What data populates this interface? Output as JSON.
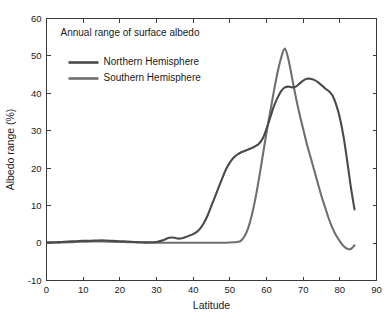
{
  "chart_data": {
    "type": "line",
    "title": "Annual range of surface albedo",
    "title_position": "inside-top-left",
    "xlabel": "Latitude",
    "ylabel": "Albedo range (%)",
    "xlim": [
      0,
      90
    ],
    "ylim": [
      -10,
      60
    ],
    "xticks": [
      0,
      10,
      20,
      30,
      40,
      50,
      60,
      70,
      80,
      90
    ],
    "yticks": [
      -10,
      0,
      10,
      20,
      30,
      40,
      50,
      60
    ],
    "xtick_labels": [
      "0",
      "10",
      "20",
      "30",
      "40",
      "50",
      "60",
      "70",
      "80",
      "90"
    ],
    "ytick_labels": [
      "-10",
      "0",
      "10",
      "20",
      "30",
      "40",
      "50",
      "60"
    ],
    "grid": false,
    "legend_position": "upper-left-inside",
    "series": [
      {
        "name": "Northern Hemisphere",
        "color": "#4a4a4a",
        "x": [
          0,
          2,
          4,
          6,
          8,
          10,
          12,
          14,
          16,
          18,
          20,
          22,
          24,
          26,
          28,
          30,
          32,
          33,
          34,
          35,
          36,
          37,
          38,
          39,
          40,
          41,
          42,
          43,
          44,
          45,
          46,
          47,
          48,
          49,
          50,
          51,
          52,
          53,
          54,
          55,
          56,
          57,
          58,
          59,
          60,
          61,
          62,
          63,
          64,
          65,
          66,
          67,
          68,
          69,
          70,
          71,
          72,
          73,
          74,
          75,
          76,
          77,
          78,
          79,
          80,
          81,
          82,
          83,
          84
        ],
        "values": [
          0.2,
          0.2,
          0.3,
          0.4,
          0.5,
          0.6,
          0.6,
          0.7,
          0.7,
          0.6,
          0.5,
          0.4,
          0.3,
          0.2,
          0.2,
          0.3,
          0.8,
          1.3,
          1.5,
          1.4,
          1.2,
          1.3,
          1.6,
          2.0,
          2.4,
          3.0,
          4.0,
          5.5,
          7.5,
          10.0,
          12.5,
          15.0,
          17.5,
          19.8,
          21.5,
          22.8,
          23.6,
          24.2,
          24.6,
          25.0,
          25.4,
          25.9,
          26.6,
          28.0,
          30.5,
          33.5,
          36.5,
          38.8,
          40.6,
          41.6,
          41.8,
          41.6,
          41.8,
          42.6,
          43.4,
          43.9,
          43.9,
          43.6,
          43.0,
          42.2,
          41.3,
          40.6,
          39.4,
          37.0,
          33.5,
          28.5,
          22.0,
          15.0,
          9.0
        ]
      },
      {
        "name": "Southern Hemisphere",
        "color": "#6f6f6f",
        "x": [
          0,
          2,
          4,
          6,
          8,
          10,
          12,
          14,
          16,
          18,
          20,
          22,
          24,
          26,
          28,
          30,
          32,
          34,
          36,
          38,
          40,
          42,
          44,
          46,
          48,
          50,
          51,
          52,
          53,
          54,
          55,
          56,
          57,
          58,
          59,
          60,
          61,
          62,
          63,
          64,
          65,
          66,
          67,
          68,
          69,
          70,
          71,
          72,
          73,
          74,
          75,
          76,
          77,
          78,
          79,
          80,
          81,
          82,
          83,
          84
        ],
        "values": [
          0.1,
          0.1,
          0.15,
          0.2,
          0.3,
          0.35,
          0.4,
          0.45,
          0.4,
          0.35,
          0.3,
          0.25,
          0.2,
          0.15,
          0.1,
          0.1,
          0.1,
          0.1,
          0.1,
          0.1,
          0.1,
          0.1,
          0.1,
          0.1,
          0.1,
          0.15,
          0.2,
          0.3,
          0.6,
          1.8,
          4.0,
          7.5,
          12.0,
          17.5,
          23.5,
          29.5,
          35.0,
          40.5,
          45.5,
          49.5,
          52.0,
          49.0,
          44.0,
          39.0,
          34.5,
          30.5,
          26.5,
          23.0,
          19.5,
          16.0,
          12.5,
          9.5,
          6.5,
          4.0,
          2.0,
          0.5,
          -0.8,
          -1.5,
          -1.6,
          -0.6
        ]
      }
    ]
  },
  "legend": {
    "entries": [
      {
        "label": "Northern Hemisphere",
        "color": "#4a4a4a"
      },
      {
        "label": "Southern Hemisphere",
        "color": "#6f6f6f"
      }
    ]
  },
  "axes": {
    "frame_color": "#3b3b3b",
    "background": "#ffffff"
  }
}
